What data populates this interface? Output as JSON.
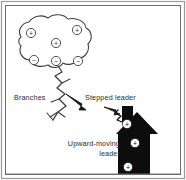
{
  "figure": {
    "background_color": "#ffffff",
    "ink_color": "#3a3a3a",
    "silhouette_color": "#0d0d0d",
    "frame": {
      "outer_color": "#8a8a8a",
      "inner_color": "#6d6d6d"
    },
    "labels": [
      {
        "id": "branches",
        "text": "Branches",
        "x": 14,
        "y": 100,
        "anchor": "start"
      },
      {
        "id": "stepped-leader",
        "text": "Stepped leader",
        "x": 85,
        "y": 100,
        "anchor": "start"
      },
      {
        "id": "upward-moving",
        "text": "Upward-moving",
        "x": 120,
        "y": 146,
        "anchor": "end"
      },
      {
        "id": "upward-leader",
        "text": "leader",
        "x": 120,
        "y": 156,
        "anchor": "end"
      }
    ],
    "cloud": {
      "name": "thundercloud",
      "charges": [
        {
          "id": "cloud-plus-1",
          "sign": "+",
          "cx": 31,
          "cy": 33,
          "r": 4.6
        },
        {
          "id": "cloud-plus-2",
          "sign": "+",
          "cx": 77,
          "cy": 30,
          "r": 4.6
        },
        {
          "id": "cloud-plus-3",
          "sign": "+",
          "cx": 56,
          "cy": 43,
          "r": 4.6
        },
        {
          "id": "cloud-minus-1",
          "sign": "−",
          "cx": 34,
          "cy": 60,
          "r": 4.6
        },
        {
          "id": "cloud-minus-2",
          "sign": "−",
          "cx": 56,
          "cy": 61,
          "r": 4.6
        },
        {
          "id": "cloud-minus-3",
          "sign": "−",
          "cx": 78,
          "cy": 61,
          "r": 4.6
        }
      ]
    },
    "house": {
      "name": "house-silhouette",
      "charges": [
        {
          "id": "house-plus-1",
          "sign": "+",
          "cx": 127,
          "cy": 124,
          "r": 4.6
        },
        {
          "id": "house-plus-2",
          "sign": "+",
          "cx": 135,
          "cy": 143,
          "r": 4.6
        },
        {
          "id": "house-plus-3",
          "sign": "+",
          "cx": 128,
          "cy": 167,
          "r": 4.6
        }
      ]
    },
    "arrows": [
      {
        "id": "stepped-leader-arrow",
        "direction": "down-right"
      },
      {
        "id": "upward-leader-arrow",
        "direction": "up-left"
      }
    ]
  }
}
